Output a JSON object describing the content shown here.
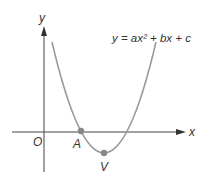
{
  "figure": {
    "equation": "y = ax² + bx + c",
    "axis_x_label": "x",
    "axis_y_label": "y",
    "origin_label": "O",
    "points": [
      {
        "name": "A",
        "label": "A",
        "description": "x-intercept"
      },
      {
        "name": "V",
        "label": "V",
        "description": "vertex"
      }
    ],
    "colors": {
      "curve": "#9a9a9a",
      "axes": "#444444",
      "points": "#888888",
      "text": "#333333"
    }
  }
}
